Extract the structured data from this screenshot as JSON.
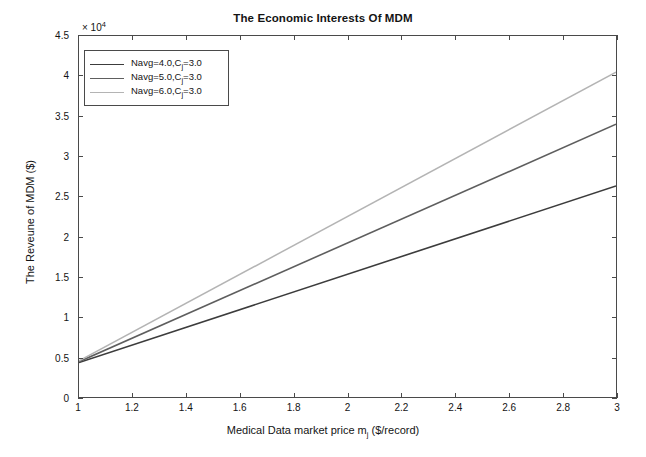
{
  "chart_data": {
    "type": "line",
    "title": "The Economic Interests Of MDM",
    "xlabel": "Medical Data market price m",
    "xlabel_sub": "j",
    "xlabel_tail": " ($/record)",
    "ylabel": "The Reveune of MDM ($)",
    "y_exponent_prefix": "× 10",
    "y_exponent_power": "4",
    "xlim": [
      1,
      3
    ],
    "ylim": [
      0,
      4.5
    ],
    "y_scale_factor": 10000,
    "grid": false,
    "legend_position": "upper left",
    "x_ticks": [
      "1",
      "1.2",
      "1.4",
      "1.6",
      "1.8",
      "2",
      "2.2",
      "2.4",
      "2.6",
      "2.8",
      "3"
    ],
    "x_tick_values": [
      1,
      1.2,
      1.4,
      1.6,
      1.8,
      2,
      2.2,
      2.4,
      2.6,
      2.8,
      3
    ],
    "y_ticks": [
      "0",
      "0.5",
      "1",
      "1.5",
      "2",
      "2.5",
      "3",
      "3.5",
      "4",
      "4.5"
    ],
    "y_tick_values": [
      0,
      0.5,
      1,
      1.5,
      2,
      2.5,
      3,
      3.5,
      4,
      4.5
    ],
    "x": [
      1,
      3
    ],
    "series": [
      {
        "name": "Navg=4.0,C",
        "name_sub": "j",
        "name_tail": "=3.0",
        "color": "#3c3c3c",
        "width": 1.6,
        "values": [
          0.43,
          2.63
        ]
      },
      {
        "name": "Navg=5.0,C",
        "name_sub": "j",
        "name_tail": "=3.0",
        "color": "#5e5e5e",
        "width": 1.6,
        "values": [
          0.44,
          3.4
        ]
      },
      {
        "name": "Navg=6.0,C",
        "name_sub": "j",
        "name_tail": "=3.0",
        "color": "#b4b4b4",
        "width": 1.5,
        "values": [
          0.45,
          4.05
        ]
      }
    ]
  }
}
